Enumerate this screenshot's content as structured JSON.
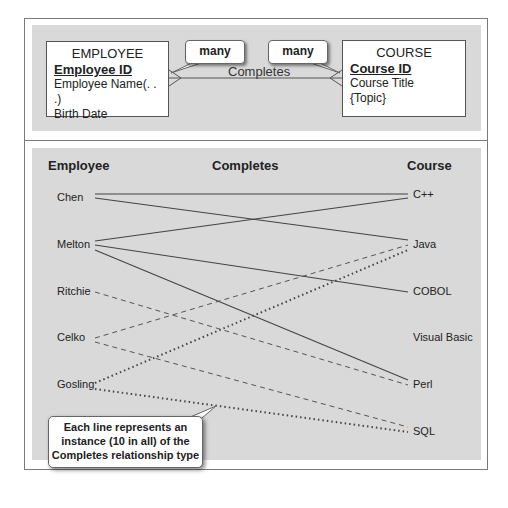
{
  "er_diagram": {
    "employee_entity": {
      "title": "EMPLOYEE",
      "primary_key": "Employee ID",
      "attributes": [
        "Employee Name(. . .)",
        "Birth Date"
      ]
    },
    "course_entity": {
      "title": "COURSE",
      "primary_key": "Course ID",
      "attributes": [
        "Course Title",
        "{Topic}"
      ]
    },
    "relationship_label": "Completes",
    "cardinality_left": "many",
    "cardinality_right": "many"
  },
  "instance_diagram": {
    "headers": {
      "employee": "Employee",
      "relationship": "Completes",
      "course": "Course"
    },
    "employees": [
      "Chen",
      "Melton",
      "Ritchie",
      "Celko",
      "Gosling"
    ],
    "courses": [
      "C++",
      "Java",
      "COBOL",
      "Visual Basic",
      "Perl",
      "SQL"
    ],
    "links": [
      {
        "employee": "Chen",
        "course": "C++",
        "style": "solid"
      },
      {
        "employee": "Chen",
        "course": "Java",
        "style": "solid"
      },
      {
        "employee": "Melton",
        "course": "C++",
        "style": "solid"
      },
      {
        "employee": "Melton",
        "course": "COBOL",
        "style": "solid"
      },
      {
        "employee": "Melton",
        "course": "Perl",
        "style": "solid"
      },
      {
        "employee": "Ritchie",
        "course": "Perl",
        "style": "dashed"
      },
      {
        "employee": "Celko",
        "course": "Java",
        "style": "dashed"
      },
      {
        "employee": "Celko",
        "course": "SQL",
        "style": "dashed"
      },
      {
        "employee": "Gosling",
        "course": "Java",
        "style": "dotted"
      },
      {
        "employee": "Gosling",
        "course": "SQL",
        "style": "dotted"
      }
    ],
    "note": {
      "line1": "Each line represents an",
      "line2": "instance (10 in all) of the",
      "line3": "Completes relationship type"
    }
  }
}
